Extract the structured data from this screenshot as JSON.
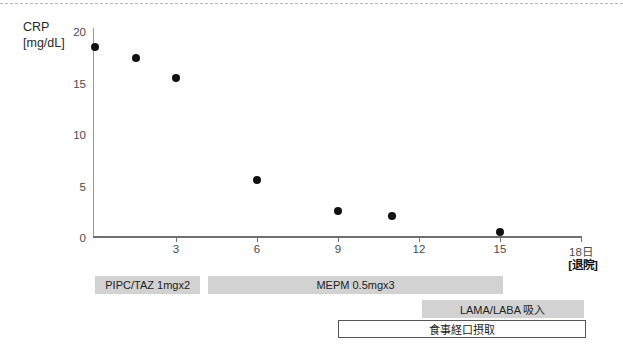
{
  "figure": {
    "y_axis_label_line1": "CRP",
    "y_axis_label_line2": "[mg/dL]",
    "discharge_note": "[退院]"
  },
  "chart_data": {
    "type": "scatter",
    "x": [
      0,
      1.5,
      3,
      6,
      9,
      11,
      15
    ],
    "y": [
      18.5,
      17.5,
      15.5,
      5.6,
      2.6,
      2.1,
      0.6
    ],
    "title": "",
    "ylabel": "CRP [mg/dL]",
    "x_unit": "日",
    "xlim": [
      0,
      18
    ],
    "ylim": [
      0,
      20
    ],
    "grid": false,
    "legend": false,
    "y_ticks": [
      20,
      15,
      10,
      5,
      0
    ],
    "y_tick_labels": [
      "20",
      "15",
      "10",
      "5",
      "0"
    ],
    "x_ticks": [
      3,
      6,
      9,
      12,
      15,
      18
    ],
    "x_tick_labels": [
      "3",
      "6",
      "9",
      "12",
      "15",
      "18日"
    ]
  },
  "treatments": [
    {
      "label": "PIPC/TAZ 1mgx2",
      "start_day": 0.0,
      "end_day": 3.9,
      "row": 1,
      "style": "filled"
    },
    {
      "label": "MEPM  0.5mgx3",
      "start_day": 4.2,
      "end_day": 15.1,
      "row": 1,
      "style": "filled"
    },
    {
      "label": "LAMA/LABA 吸入",
      "start_day": 12.1,
      "end_day": 18.1,
      "row": 2,
      "style": "filled"
    },
    {
      "label": "食事経口摂取",
      "start_day": 9.0,
      "end_day": 18.2,
      "row": 3,
      "style": "outlined"
    }
  ],
  "colors": {
    "bar_fill": "#d2d2d2",
    "bar_outline_border": "#555555",
    "bar_outline_fill": "#ffffff",
    "point": "#111111",
    "axis": "#6f6f6f",
    "tick_text": "#4a4a4a",
    "label_text": "#2a2a2a",
    "top_rule": "#bbbbbb"
  }
}
